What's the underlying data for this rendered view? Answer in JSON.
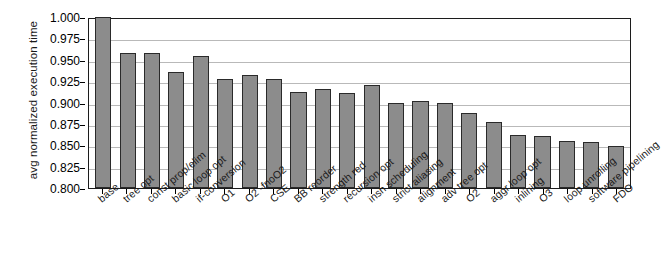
{
  "chart_data": {
    "type": "bar",
    "title": "",
    "xlabel": "",
    "ylabel": "avg normalized execution time",
    "ylim": [
      0.8,
      1.0
    ],
    "ytick_labels": [
      "1.000",
      "0.975",
      "0.950",
      "0.925",
      "0.900",
      "0.875",
      "0.850",
      "0.825",
      "0.800"
    ],
    "ytick_values": [
      1.0,
      0.975,
      0.95,
      0.925,
      0.9,
      0.875,
      0.85,
      0.825,
      0.8
    ],
    "grid": true,
    "legend": "none",
    "bar_color": "#8c8c8c",
    "bar_edge_color": "#2a2a2a",
    "axis_color": "#1c1c1c",
    "grid_color": "#b9b9b9",
    "categories": [
      "base",
      "tree opt",
      "const prop/elim",
      "basic loop opt",
      "if-conversion",
      "O1",
      "O2 -fnoO2",
      "CSE",
      "BB reorder",
      "strength red",
      "recursion opt",
      "insn scheduling",
      "strict aliasing",
      "alignment",
      "adv tree opt",
      "O2",
      "aggr loop opt",
      "inlining",
      "O3",
      "loop unrolling",
      "software pipelining",
      "FDO"
    ],
    "values": [
      1.0,
      0.958,
      0.958,
      0.936,
      0.954,
      0.928,
      0.932,
      0.928,
      0.912,
      0.916,
      0.911,
      0.921,
      0.9,
      0.902,
      0.9,
      0.888,
      0.877,
      0.862,
      0.861,
      0.855,
      0.854,
      0.849
    ]
  }
}
